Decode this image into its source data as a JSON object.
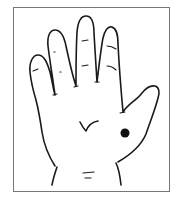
{
  "figure": {
    "marker": {
      "type": "dot",
      "location": "base-of-thumb-palm",
      "color": "#111111"
    },
    "colors": {
      "line": "#1a1a1a",
      "frame": "#777777",
      "background": "#ffffff"
    }
  }
}
